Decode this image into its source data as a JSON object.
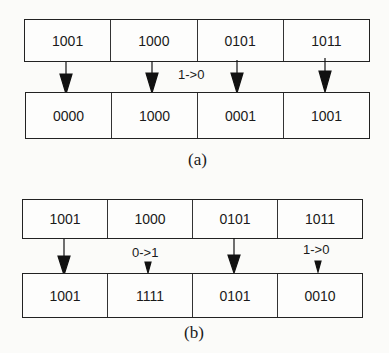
{
  "panels": [
    {
      "id": "a",
      "caption": "(a)",
      "input": [
        "1001",
        "1000",
        "0101",
        "1011"
      ],
      "output": [
        "0000",
        "1000",
        "0001",
        "1001"
      ],
      "arrows": [
        "large",
        "large",
        "large",
        "large"
      ],
      "annotations": [
        {
          "text": "1->0",
          "between": "cells 2 and 3"
        }
      ]
    },
    {
      "id": "b",
      "caption": "(b)",
      "input": [
        "1001",
        "1000",
        "0101",
        "1011"
      ],
      "output": [
        "1001",
        "1111",
        "0101",
        "0010"
      ],
      "arrows": [
        "large",
        "small",
        "large",
        "small"
      ],
      "annotations": [
        {
          "text": "0->1",
          "above_arrow": 2
        },
        {
          "text": "1->0",
          "above_arrow": 4
        }
      ]
    }
  ]
}
